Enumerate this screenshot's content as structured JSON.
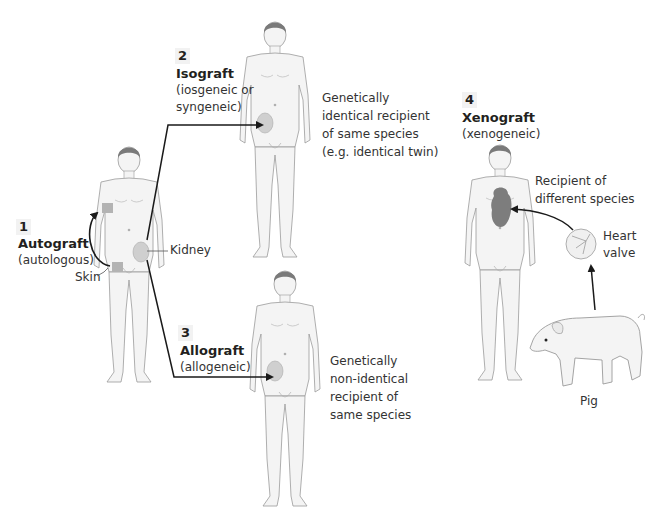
{
  "diagram": {
    "colors": {
      "body_fill": "#f4f4f4",
      "body_stroke": "#9a9a9a",
      "hair": "#7a7a7a",
      "organ_fill": "#cfcfcf",
      "heart_fill": "#7d7d7d",
      "skin_patch": "#b3b3b3",
      "arrow": "#1a1a1a",
      "text": "#231f20"
    },
    "panels": [
      {
        "number": "1",
        "name": "Autograft",
        "qualifier": "(autologous)",
        "labels": {
          "skin": "Skin",
          "kidney": "Kidney"
        }
      },
      {
        "number": "2",
        "name": "Isograft",
        "qualifier_line1": "(iosgeneic or",
        "qualifier_line2": "syngeneic)",
        "description": [
          "Genetically",
          "identical recipient",
          "of same species",
          "(e.g. identical twin)"
        ]
      },
      {
        "number": "3",
        "name": "Allograft",
        "qualifier": "(allogeneic)",
        "description": [
          "Genetically",
          "non-identical",
          "recipient of",
          "same species"
        ]
      },
      {
        "number": "4",
        "name": "Xenograft",
        "qualifier": "(xenogeneic)",
        "description": [
          "Recipient of",
          "different species"
        ],
        "labels": {
          "heart_valve_1": "Heart",
          "heart_valve_2": "valve",
          "donor": "Pig"
        }
      }
    ]
  }
}
